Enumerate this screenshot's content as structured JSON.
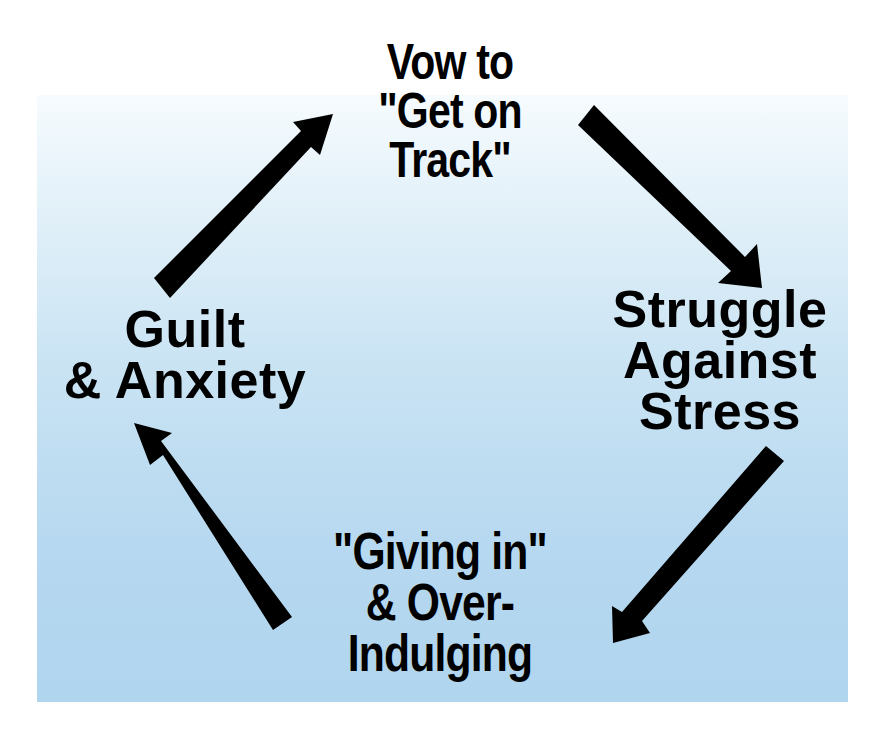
{
  "diagram": {
    "type": "cycle",
    "background_gradient": [
      "#f6fbfe",
      "#b0d5ee"
    ],
    "text_color": "#000000",
    "arrow_color": "#000000",
    "stages": [
      {
        "id": "vow",
        "lines": [
          "Vow to",
          "\"Get on",
          "Track\""
        ]
      },
      {
        "id": "struggle",
        "lines": [
          "Struggle",
          "Against",
          "Stress"
        ]
      },
      {
        "id": "giving",
        "lines": [
          "\"Giving in\"",
          "& Over-",
          "Indulging"
        ]
      },
      {
        "id": "guilt",
        "lines": [
          "Guilt",
          "& Anxiety"
        ]
      }
    ],
    "arrows": [
      {
        "from": "vow",
        "to": "struggle"
      },
      {
        "from": "struggle",
        "to": "giving"
      },
      {
        "from": "giving",
        "to": "guilt"
      },
      {
        "from": "guilt",
        "to": "vow"
      }
    ]
  }
}
